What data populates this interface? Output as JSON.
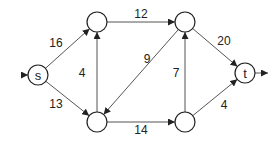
{
  "graph": {
    "type": "flow-network",
    "nodes": [
      {
        "id": "s",
        "label": "s"
      },
      {
        "id": "a",
        "label": ""
      },
      {
        "id": "b",
        "label": ""
      },
      {
        "id": "c",
        "label": ""
      },
      {
        "id": "d",
        "label": ""
      },
      {
        "id": "t",
        "label": "t"
      }
    ],
    "edges": [
      {
        "from": "s",
        "to": "a",
        "capacity": "16"
      },
      {
        "from": "s",
        "to": "b",
        "capacity": "13"
      },
      {
        "from": "b",
        "to": "a",
        "capacity": "4"
      },
      {
        "from": "a",
        "to": "c",
        "capacity": "12"
      },
      {
        "from": "c",
        "to": "b",
        "capacity": "9"
      },
      {
        "from": "b",
        "to": "d",
        "capacity": "14"
      },
      {
        "from": "d",
        "to": "c",
        "capacity": "7"
      },
      {
        "from": "c",
        "to": "t",
        "capacity": "20"
      },
      {
        "from": "d",
        "to": "t",
        "capacity": "4"
      }
    ],
    "source_arrow": true,
    "sink_arrow": true
  }
}
